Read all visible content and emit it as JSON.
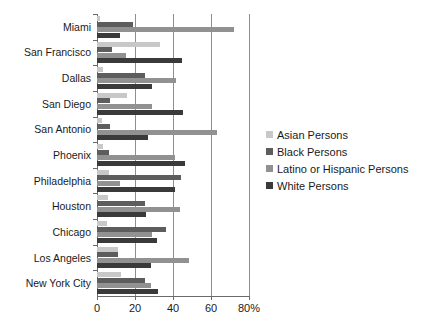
{
  "chart_data": {
    "type": "bar",
    "orientation": "horizontal",
    "title": "",
    "xlabel": "",
    "ylabel": "",
    "xlim": [
      0,
      80
    ],
    "xticks": [
      0,
      20,
      40,
      60,
      80
    ],
    "xtick_labels": [
      "0",
      "20",
      "40",
      "60",
      "80%"
    ],
    "grid": "vertical",
    "legend_position": "right",
    "categories": [
      "Miami",
      "San Francisco",
      "Dallas",
      "San Diego",
      "San Antonio",
      "Phoenix",
      "Philadelphia",
      "Houston",
      "Chicago",
      "Los Angeles",
      "New York City"
    ],
    "series": [
      {
        "name": "Asian Persons",
        "color": "#c8c8c8",
        "values": [
          1.5,
          33.0,
          2.9,
          15.9,
          2.4,
          3.2,
          6.3,
          6.0,
          5.5,
          11.3,
          12.6
        ]
      },
      {
        "name": "Black Persons",
        "color": "#5d5d5d",
        "values": [
          19.2,
          7.8,
          25.0,
          6.7,
          6.9,
          6.5,
          44.3,
          25.3,
          36.4,
          11.2,
          25.5
        ]
      },
      {
        "name": "Latino or Hispanic Persons",
        "color": "#919191",
        "values": [
          72.0,
          15.1,
          41.7,
          28.8,
          63.2,
          40.8,
          12.3,
          43.8,
          28.9,
          48.5,
          28.6
        ]
      },
      {
        "name": "White Persons",
        "color": "#3a3a3a",
        "values": [
          11.9,
          44.6,
          28.8,
          45.1,
          26.6,
          46.5,
          41.0,
          25.6,
          31.7,
          28.5,
          32.1
        ]
      }
    ]
  }
}
